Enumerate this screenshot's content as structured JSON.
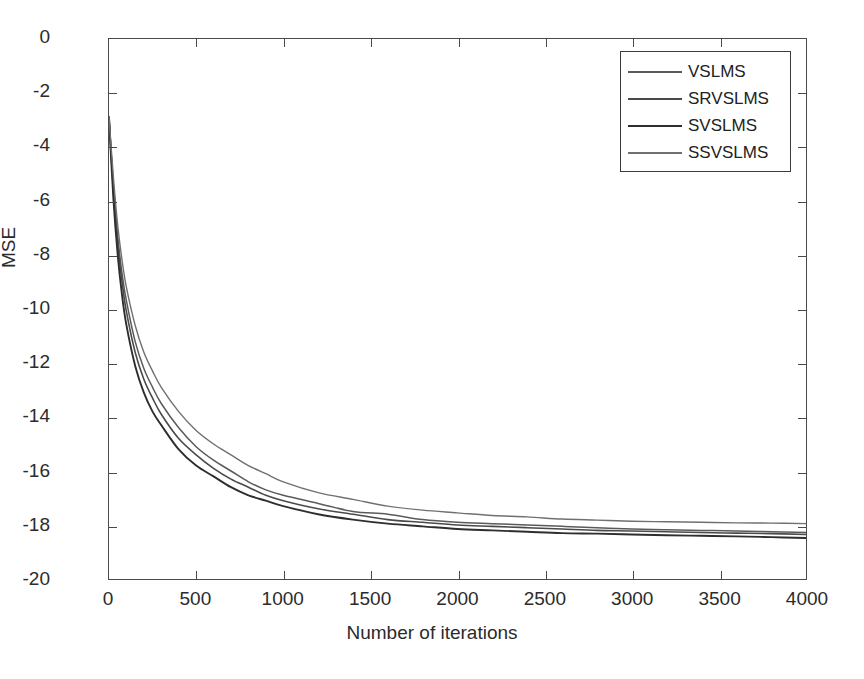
{
  "chart_data": {
    "type": "line",
    "title": "",
    "xlabel": "Number of iterations",
    "ylabel": "MSE",
    "xlim": [
      0,
      4000
    ],
    "ylim": [
      -20,
      0
    ],
    "grid": false,
    "legend_position": "upper right",
    "xticks": [
      0,
      500,
      1000,
      1500,
      2000,
      2500,
      3000,
      3500,
      4000
    ],
    "xtick_labels": [
      "0",
      "500",
      "1000",
      "1500",
      "2000",
      "2500",
      "3000",
      "3500",
      "4000"
    ],
    "yticks": [
      0,
      -2,
      -4,
      -6,
      -8,
      -10,
      -12,
      -14,
      -16,
      -18,
      -20
    ],
    "ytick_labels": [
      "0",
      "-2",
      "-4",
      "-6",
      "-8",
      "-10",
      "-12",
      "-14",
      "-16",
      "-18",
      "-20"
    ],
    "x": [
      0,
      25,
      50,
      75,
      100,
      150,
      200,
      250,
      300,
      400,
      500,
      600,
      700,
      800,
      900,
      1000,
      1200,
      1400,
      1600,
      1800,
      2000,
      2200,
      2400,
      2600,
      2800,
      3000,
      3200,
      3400,
      3600,
      3800,
      4000
    ],
    "series": [
      {
        "name": "VSLMS",
        "color": "#5a5a5a",
        "line_width": 1.5,
        "values": [
          -2.9,
          -5.4,
          -7.3,
          -8.7,
          -9.7,
          -11.2,
          -12.2,
          -12.9,
          -13.5,
          -14.4,
          -15.1,
          -15.6,
          -16.0,
          -16.4,
          -16.7,
          -16.9,
          -17.2,
          -17.5,
          -17.6,
          -17.8,
          -17.9,
          -17.95,
          -18.0,
          -18.05,
          -18.1,
          -18.15,
          -18.18,
          -18.2,
          -18.22,
          -18.25,
          -18.28
        ]
      },
      {
        "name": "SRVSLMS",
        "color": "#4a4a4a",
        "line_width": 1.6,
        "values": [
          -2.9,
          -5.6,
          -7.6,
          -9.0,
          -10.1,
          -11.6,
          -12.6,
          -13.3,
          -13.9,
          -14.8,
          -15.4,
          -15.9,
          -16.3,
          -16.6,
          -16.9,
          -17.1,
          -17.4,
          -17.6,
          -17.8,
          -17.9,
          -18.0,
          -18.05,
          -18.1,
          -18.15,
          -18.2,
          -18.22,
          -18.25,
          -18.28,
          -18.3,
          -18.32,
          -18.35
        ]
      },
      {
        "name": "SVSLMS",
        "color": "#2e2e2e",
        "line_width": 1.9,
        "values": [
          -2.9,
          -5.9,
          -8.0,
          -9.5,
          -10.6,
          -12.1,
          -13.1,
          -13.8,
          -14.3,
          -15.2,
          -15.8,
          -16.2,
          -16.6,
          -16.9,
          -17.1,
          -17.3,
          -17.6,
          -17.8,
          -17.95,
          -18.05,
          -18.15,
          -18.2,
          -18.25,
          -18.3,
          -18.32,
          -18.35,
          -18.38,
          -18.4,
          -18.42,
          -18.45,
          -18.48
        ]
      },
      {
        "name": "SSVSLMS",
        "color": "#707070",
        "line_width": 1.4,
        "values": [
          -2.9,
          -5.1,
          -6.9,
          -8.2,
          -9.2,
          -10.6,
          -11.6,
          -12.3,
          -12.9,
          -13.8,
          -14.5,
          -15.0,
          -15.4,
          -15.8,
          -16.1,
          -16.4,
          -16.8,
          -17.05,
          -17.3,
          -17.45,
          -17.55,
          -17.65,
          -17.7,
          -17.78,
          -17.82,
          -17.86,
          -17.88,
          -17.9,
          -17.92,
          -17.93,
          -17.95
        ]
      }
    ]
  }
}
